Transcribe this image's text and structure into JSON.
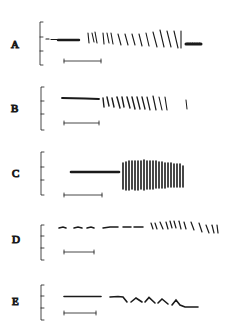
{
  "figure": {
    "ink_color": "#1a1a1a",
    "panels": [
      {
        "label": "A"
      },
      {
        "label": "B"
      },
      {
        "label": "C"
      },
      {
        "label": "D"
      },
      {
        "label": "E"
      }
    ]
  }
}
